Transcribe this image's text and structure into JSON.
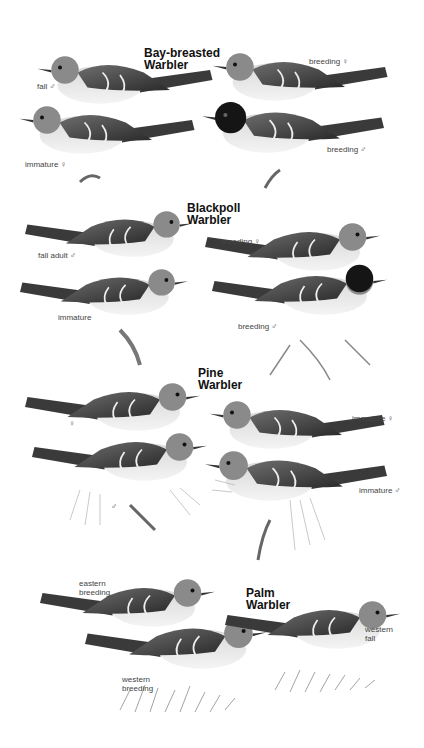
{
  "plate": {
    "species": [
      {
        "name_line1": "Bay-breasted",
        "name_line2": "Warbler",
        "labels": [
          "fall ♂",
          "breeding ♀",
          "immature ♀",
          "breeding ♂"
        ]
      },
      {
        "name_line1": "Blackpoll",
        "name_line2": "Warbler",
        "labels": [
          "fall adult ♂",
          "breeding ♀",
          "immature",
          "breeding ♂"
        ]
      },
      {
        "name_line1": "Pine",
        "name_line2": "Warbler",
        "labels": [
          "♀",
          "immature ♀",
          "♂",
          "immature ♂"
        ]
      },
      {
        "name_line1": "Palm",
        "name_line2": "Warbler",
        "labels": [
          "eastern\nbreeding",
          "western\nfall",
          "western\nbreeding"
        ]
      }
    ]
  },
  "colors": {
    "background": "#ffffff",
    "ink": "#111111",
    "label": "#444444"
  }
}
